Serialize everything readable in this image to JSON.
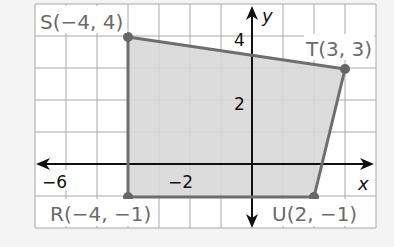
{
  "diagram": {
    "type": "coordinate-plane-quadrilateral",
    "axes": {
      "x_label": "x",
      "y_label": "y"
    },
    "tick_labels": {
      "x": [
        {
          "value": -6,
          "text": "−6"
        },
        {
          "value": -2,
          "text": "−2"
        }
      ],
      "y": [
        {
          "value": 4,
          "text": "4"
        },
        {
          "value": 2,
          "text": "2"
        }
      ]
    },
    "vertices": [
      {
        "name": "S",
        "x": -4,
        "y": 4,
        "label": "S(−4, 4)"
      },
      {
        "name": "T",
        "x": 3,
        "y": 3,
        "label": "T(3, 3)"
      },
      {
        "name": "U",
        "x": 2,
        "y": -1,
        "label": "U(2, −1)"
      },
      {
        "name": "R",
        "x": -4,
        "y": -1,
        "label": "R(−4, −1)"
      }
    ],
    "grid": {
      "x_min": -7,
      "x_max": 4,
      "y_min": -2,
      "y_max": 5
    },
    "colors": {
      "fill": "#d6d6d6",
      "edge": "#6e6e6e",
      "grid": "#a8a8a8",
      "axis": "#111111",
      "label": "#6a6a6a",
      "background": "#ffffff"
    }
  }
}
